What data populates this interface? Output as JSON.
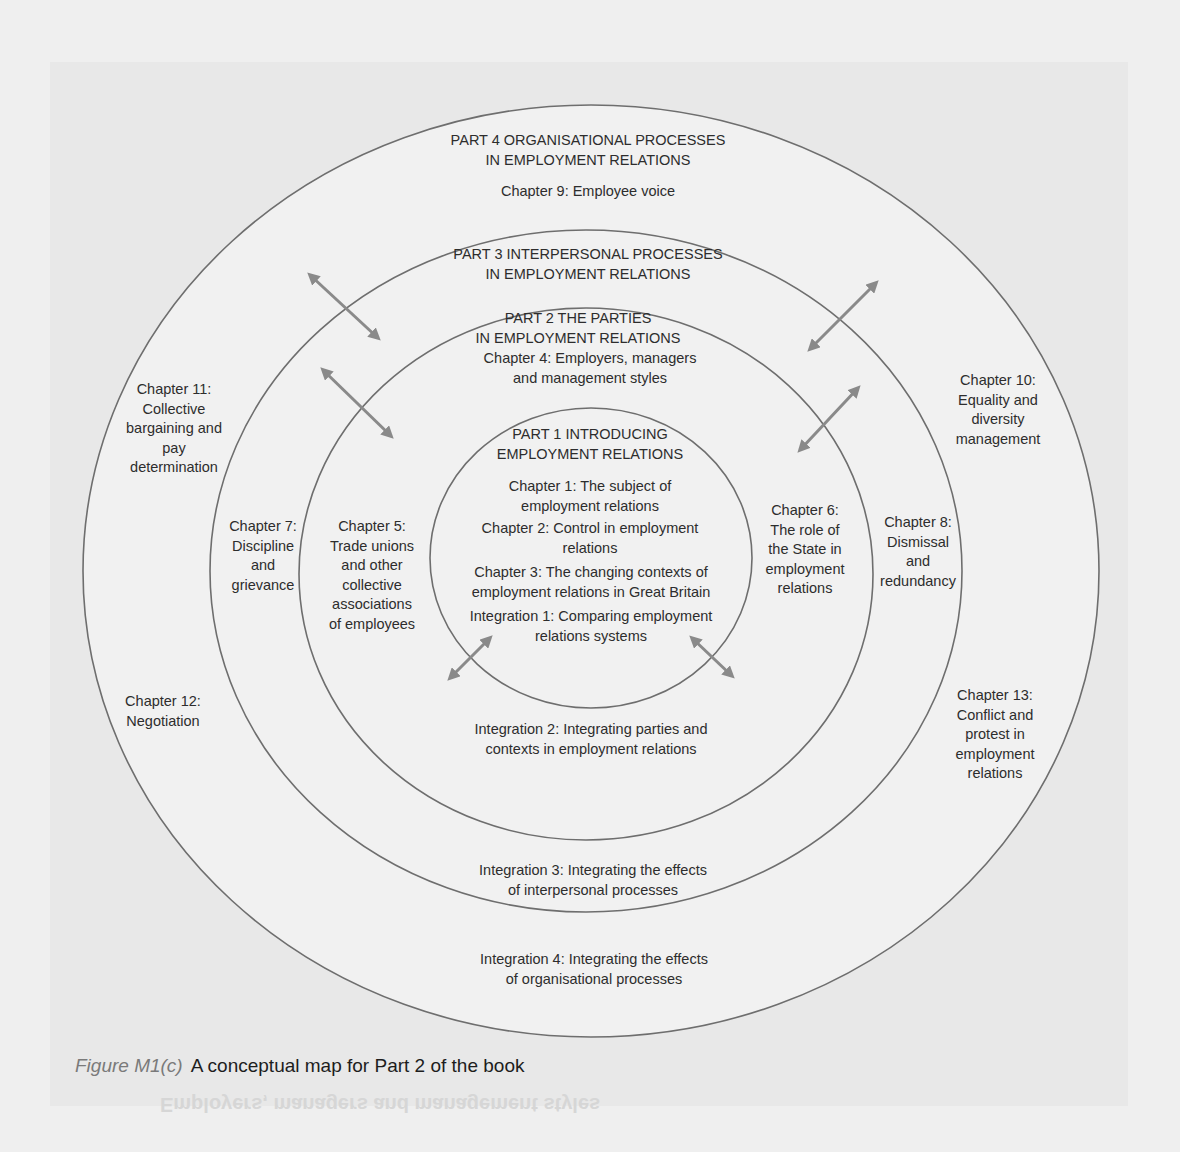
{
  "diagram": {
    "rings": [
      {
        "id": "part4",
        "cx": 591,
        "cy": 571,
        "rx": 508,
        "ry": 466
      },
      {
        "id": "part3",
        "cx": 586,
        "cy": 571,
        "rx": 376,
        "ry": 341
      },
      {
        "id": "part2",
        "cx": 586,
        "cy": 574,
        "rx": 287,
        "ry": 266
      },
      {
        "id": "part1",
        "cx": 591,
        "cy": 558,
        "rx": 161,
        "ry": 150
      }
    ],
    "stroke_color": "#6e6e6e",
    "arrow_color": "#8a8a8a",
    "part4": {
      "title_line1": "PART 4 ORGANISATIONAL PROCESSES",
      "title_line2": "IN EMPLOYMENT RELATIONS",
      "chapter9": "Chapter 9: Employee voice",
      "chapter10": [
        "Chapter 10:",
        "Equality and",
        "diversity",
        "management"
      ],
      "chapter11": [
        "Chapter 11:",
        "Collective",
        "bargaining and",
        "pay",
        "determination"
      ],
      "chapter12": [
        "Chapter 12:",
        "Negotiation"
      ],
      "chapter13": [
        "Chapter 13:",
        "Conflict and",
        "protest in",
        "employment",
        "relations"
      ],
      "integration4": [
        "Integration 4: Integrating the effects",
        "of organisational processes"
      ]
    },
    "part3": {
      "title_line1": "PART 3 INTERPERSONAL PROCESSES",
      "title_line2": "IN EMPLOYMENT RELATIONS",
      "chapter7": [
        "Chapter 7:",
        "Discipline",
        "and",
        "grievance"
      ],
      "chapter8": [
        "Chapter 8:",
        "Dismissal",
        "and",
        "redundancy"
      ],
      "integration3": [
        "Integration 3: Integrating the effects",
        "of interpersonal processes"
      ]
    },
    "part2": {
      "title_line1": "PART 2 THE PARTIES",
      "title_line2": "IN EMPLOYMENT RELATIONS",
      "chapter4": [
        "Chapter 4: Employers, managers",
        "and management styles"
      ],
      "chapter5": [
        "Chapter 5:",
        "Trade unions",
        "and other",
        "collective",
        "associations",
        "of employees"
      ],
      "chapter6": [
        "Chapter 6:",
        "The role of",
        "the State in",
        "employment",
        "relations"
      ],
      "integration2": [
        "Integration 2: Integrating parties and",
        "contexts in employment relations"
      ]
    },
    "part1": {
      "title_line1": "PART 1 INTRODUCING",
      "title_line2": "EMPLOYMENT RELATIONS",
      "chapter1": [
        "Chapter 1: The subject of",
        "employment relations"
      ],
      "chapter2": [
        "Chapter 2: Control in employment",
        "relations"
      ],
      "chapter3": [
        "Chapter 3: The changing contexts of",
        "employment relations in Great Britain"
      ],
      "integration1": [
        "Integration 1: Comparing employment",
        "relations systems"
      ]
    },
    "arrows": [
      {
        "x1": 310,
        "y1": 275,
        "x2": 378,
        "y2": 338
      },
      {
        "x1": 323,
        "y1": 370,
        "x2": 391,
        "y2": 436
      },
      {
        "x1": 876,
        "y1": 283,
        "x2": 810,
        "y2": 349
      },
      {
        "x1": 858,
        "y1": 388,
        "x2": 800,
        "y2": 450
      },
      {
        "x1": 490,
        "y1": 638,
        "x2": 450,
        "y2": 678
      },
      {
        "x1": 692,
        "y1": 638,
        "x2": 732,
        "y2": 676
      }
    ]
  },
  "caption": {
    "figure_label": "Figure M1(c)",
    "text": "A conceptual map for Part 2 of the book"
  },
  "bleed_through_text": "Employers, managers and management styles"
}
